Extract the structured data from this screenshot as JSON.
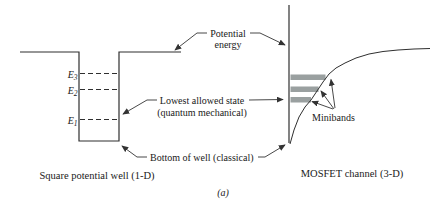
{
  "figure": {
    "panel_label": "(a)",
    "annotations": {
      "potential_energy_line1": "Potential",
      "potential_energy_line2": "energy",
      "lowest_state_line1": "Lowest allowed state",
      "lowest_state_line2": "(quantum mechanical)",
      "bottom_of_well": "Bottom of well (classical)"
    },
    "left_panel": {
      "caption": "Square potential well (1-D)",
      "energy_levels": [
        {
          "symbol": "E",
          "subscript": "3"
        },
        {
          "symbol": "E",
          "subscript": "2"
        },
        {
          "symbol": "E",
          "subscript": "1"
        }
      ]
    },
    "right_panel": {
      "caption": "MOSFET channel (3-D)",
      "minibands_label": "Minibands",
      "miniband_count": 3
    },
    "colors": {
      "line": "#2f2f2f",
      "arrow": "#333333",
      "miniband_fill": "#9aa0a0",
      "text": "#1a1a1a",
      "background": "#ffffff"
    }
  }
}
